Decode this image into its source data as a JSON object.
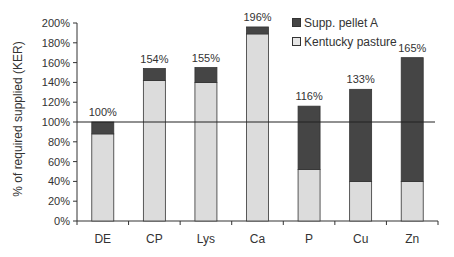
{
  "chart_data": {
    "type": "bar",
    "stacked": true,
    "title": "",
    "xlabel": "",
    "ylabel": "% of required supplied (KER)",
    "ylim": [
      0,
      200
    ],
    "yticks": [
      "0%",
      "20%",
      "40%",
      "60%",
      "80%",
      "100%",
      "120%",
      "140%",
      "160%",
      "180%",
      "200%"
    ],
    "categories": [
      "DE",
      "CP",
      "Lys",
      "Ca",
      "P",
      "Cu",
      "Zn"
    ],
    "series": [
      {
        "name": "Kentucky pasture",
        "color": "#dcdcdc",
        "values": [
          88,
          142,
          140,
          189,
          52,
          40,
          40
        ]
      },
      {
        "name": "Supp. pellet A",
        "color": "#454545",
        "values": [
          12,
          12,
          15,
          7,
          64,
          93,
          125
        ]
      }
    ],
    "totals_labels": [
      "100%",
      "154%",
      "155%",
      "196%",
      "116%",
      "133%",
      "165%"
    ],
    "totals": [
      100,
      154,
      155,
      196,
      116,
      133,
      165
    ],
    "reference_line": {
      "y": 100,
      "label": "100% requirement"
    },
    "legend": {
      "position": "upper-right-inside",
      "entries": [
        "Supp. pellet A",
        "Kentucky pasture"
      ]
    },
    "grid": false
  },
  "labels": {
    "ylabel": "% of required supplied (KER)",
    "legend_pellet": "Supp. pellet A",
    "legend_pasture": "Kentucky pasture"
  }
}
